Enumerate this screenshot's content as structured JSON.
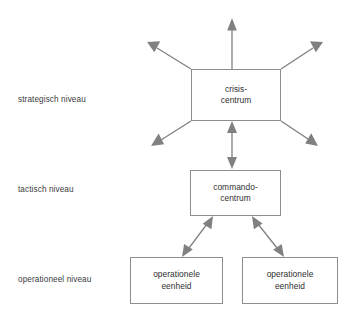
{
  "diagram": {
    "background_color": "#ffffff",
    "line_color": "#8e8e8e",
    "arrow_color": "#808080",
    "text_color": "#2f2f2f",
    "levels": [
      {
        "id": "strategisch",
        "label": "strategisch niveau"
      },
      {
        "id": "tactisch",
        "label": "tactisch niveau"
      },
      {
        "id": "operationeel",
        "label": "operationeel niveau"
      }
    ],
    "nodes": [
      {
        "id": "crisis-centrum",
        "level": "strategisch",
        "line1": "crisis-",
        "line2": "centrum"
      },
      {
        "id": "commando-centrum",
        "level": "tactisch",
        "line1": "commando-",
        "line2": "centrum"
      },
      {
        "id": "operationele-eenheid-left",
        "level": "operationeel",
        "line1": "operationele",
        "line2": "eenheid"
      },
      {
        "id": "operationele-eenheid-right",
        "level": "operationeel",
        "line1": "operationele",
        "line2": "eenheid"
      }
    ],
    "connectors": [
      {
        "id": "crisis-out-up",
        "from": "crisis-centrum",
        "to": "external",
        "heads": "single"
      },
      {
        "id": "crisis-out-upper-left",
        "from": "crisis-centrum",
        "to": "external",
        "heads": "single"
      },
      {
        "id": "crisis-out-upper-right",
        "from": "crisis-centrum",
        "to": "external",
        "heads": "single"
      },
      {
        "id": "crisis-out-lower-left",
        "from": "crisis-centrum",
        "to": "external",
        "heads": "single"
      },
      {
        "id": "crisis-out-lower-right",
        "from": "crisis-centrum",
        "to": "external",
        "heads": "single"
      },
      {
        "id": "crisis-commando",
        "from": "crisis-centrum",
        "to": "commando-centrum",
        "heads": "double"
      },
      {
        "id": "commando-op-left",
        "from": "commando-centrum",
        "to": "operationele-eenheid-left",
        "heads": "double"
      },
      {
        "id": "commando-op-right",
        "from": "commando-centrum",
        "to": "operationele-eenheid-right",
        "heads": "double"
      }
    ],
    "footer_caption": ""
  }
}
